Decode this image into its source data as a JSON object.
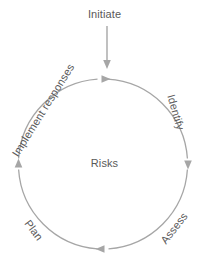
{
  "diagram": {
    "title_label": "Initiate",
    "center_label": "Risks",
    "cycle_labels": [
      {
        "id": "identify",
        "text": "Identify"
      },
      {
        "id": "assess",
        "text": "Assess"
      },
      {
        "id": "plan",
        "text": "Plan"
      },
      {
        "id": "implement-responses",
        "text": "Implement responses"
      }
    ],
    "colors": {
      "stroke": "#a6a6a6",
      "text": "#595959",
      "background": "#ffffff"
    },
    "geometry": {
      "center_x": 103,
      "center_y": 164,
      "radius": 85,
      "direction": "clockwise",
      "entry_arrow_x": 107,
      "entry_arrow_top_y": 26,
      "entry_arrow_bottom_y": 68
    }
  }
}
